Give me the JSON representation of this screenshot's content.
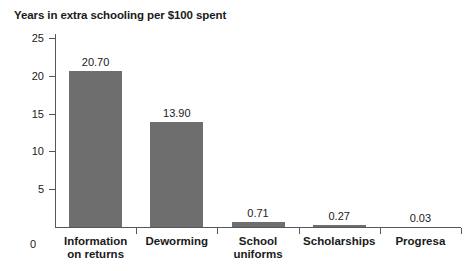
{
  "chart_data": {
    "type": "bar",
    "title": "Years in extra schooling per $100 spent",
    "xlabel": "",
    "ylabel": "",
    "ylim": [
      0,
      25
    ],
    "yticks": [
      0,
      5,
      10,
      15,
      20,
      25
    ],
    "ytick_labels": [
      "0",
      "5",
      "10",
      "15",
      "20",
      "25"
    ],
    "grid": false,
    "legend": null,
    "bar_color": "#6e6e6e",
    "axis_color": "#55585a",
    "text_color": "#1a1a1a",
    "categories": [
      "Information on returns",
      "Deworming",
      "School uniforms",
      "Scholarships",
      "Progresa"
    ],
    "category_lines": [
      [
        "Information",
        "on returns"
      ],
      [
        "Deworming"
      ],
      [
        "School",
        "uniforms"
      ],
      [
        "Scholarships"
      ],
      [
        "Progresa"
      ]
    ],
    "values": [
      20.7,
      13.9,
      0.71,
      0.27,
      0.03
    ],
    "value_labels": [
      "20.70",
      "13.90",
      "0.71",
      "0.27",
      "0.03"
    ]
  }
}
